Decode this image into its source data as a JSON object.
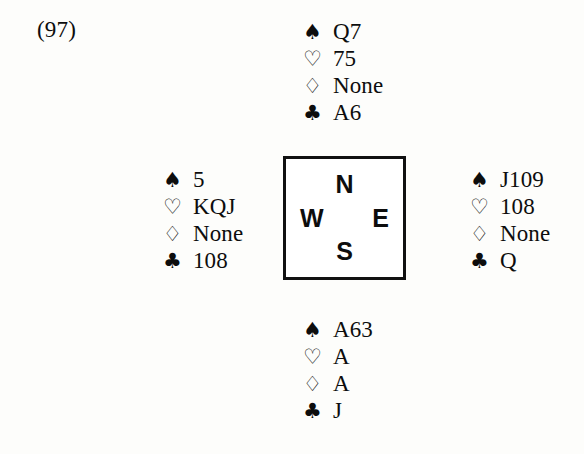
{
  "diagram": {
    "deal_label": "(97)",
    "suit_glyphs": {
      "spades": "♠",
      "hearts": "♡",
      "diamonds": "♢",
      "clubs": "♣"
    },
    "compass": {
      "north": "N",
      "west": "W",
      "east": "E",
      "south": "S"
    },
    "hands": {
      "north": {
        "seat": "North",
        "rows": [
          {
            "suit": "spades",
            "glyph": "♠",
            "fill": "solid",
            "holding": "Q7"
          },
          {
            "suit": "hearts",
            "glyph": "♡",
            "fill": "hollow",
            "holding": "75"
          },
          {
            "suit": "diamonds",
            "glyph": "♢",
            "fill": "hollow",
            "holding": "None"
          },
          {
            "suit": "clubs",
            "glyph": "♣",
            "fill": "solid",
            "holding": "A6"
          }
        ]
      },
      "west": {
        "seat": "West",
        "rows": [
          {
            "suit": "spades",
            "glyph": "♠",
            "fill": "solid",
            "holding": "5"
          },
          {
            "suit": "hearts",
            "glyph": "♡",
            "fill": "hollow",
            "holding": "KQJ"
          },
          {
            "suit": "diamonds",
            "glyph": "♢",
            "fill": "hollow",
            "holding": "None"
          },
          {
            "suit": "clubs",
            "glyph": "♣",
            "fill": "solid",
            "holding": "108"
          }
        ]
      },
      "east": {
        "seat": "East",
        "rows": [
          {
            "suit": "spades",
            "glyph": "♠",
            "fill": "solid",
            "holding": "J109"
          },
          {
            "suit": "hearts",
            "glyph": "♡",
            "fill": "hollow",
            "holding": "108"
          },
          {
            "suit": "diamonds",
            "glyph": "♢",
            "fill": "hollow",
            "holding": "None"
          },
          {
            "suit": "clubs",
            "glyph": "♣",
            "fill": "solid",
            "holding": "Q"
          }
        ]
      },
      "south": {
        "seat": "South",
        "rows": [
          {
            "suit": "spades",
            "glyph": "♠",
            "fill": "solid",
            "holding": "A63"
          },
          {
            "suit": "hearts",
            "glyph": "♡",
            "fill": "hollow",
            "holding": "A"
          },
          {
            "suit": "diamonds",
            "glyph": "♢",
            "fill": "hollow",
            "holding": "A"
          },
          {
            "suit": "clubs",
            "glyph": "♣",
            "fill": "solid",
            "holding": "J"
          }
        ]
      }
    },
    "colors": {
      "ink": "#0d0d0d",
      "paper": "#fdfdfb",
      "box_border": "#111111"
    }
  }
}
